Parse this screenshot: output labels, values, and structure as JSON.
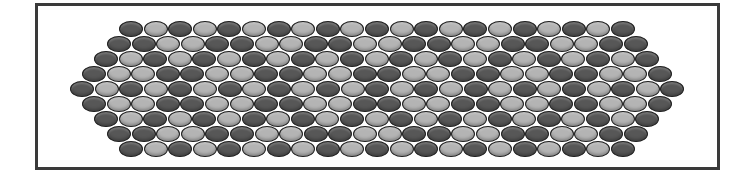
{
  "title": "",
  "pattern": {
    "type": "bead-pattern",
    "shape": "elongated-hexagon",
    "frame": {
      "left": 35,
      "top": 3,
      "right": 717,
      "bottom": 167,
      "border_color": "#3a3a3a"
    },
    "bead": {
      "width": 24,
      "height": 16,
      "spacing_x": 24.6,
      "spacing_y": 15
    },
    "palette": {
      "D": "#575757",
      "M": "#7e7e7e",
      "L": "#b4b4b4"
    },
    "rows": [
      {
        "y": 29,
        "x0": 131,
        "beads": "DLDLDLDLDLDLDLDLDLDLD"
      },
      {
        "y": 44,
        "x0": 119,
        "beads": "DDLLDDLLDDLLDDLLDDLLDD"
      },
      {
        "y": 59,
        "x0": 106,
        "beads": "DLDLDLDLDLDLDLDLDLDLDLD"
      },
      {
        "y": 74,
        "x0": 94,
        "beads": "DLLDDLLDDLLDDLLDDLLDDLLD"
      },
      {
        "y": 89,
        "x0": 82,
        "beads": "DLDLDLDLDLDLDLDLDLDLDLDLD"
      },
      {
        "y": 104,
        "x0": 94,
        "beads": "DLLDDLLDDLLDDLLDDLLDDLLD"
      },
      {
        "y": 119,
        "x0": 106,
        "beads": "DLDLDLDLDLDLDLDLDLDLDLD"
      },
      {
        "y": 134,
        "x0": 119,
        "beads": "DDLLDDLLDDLLDDLLDDLLDD"
      },
      {
        "y": 149,
        "x0": 131,
        "beads": "DLDLDLDLDLDLDLDLDLDLD"
      }
    ],
    "row_counts": [
      21,
      22,
      23,
      24,
      25,
      24,
      23,
      22,
      21
    ]
  }
}
